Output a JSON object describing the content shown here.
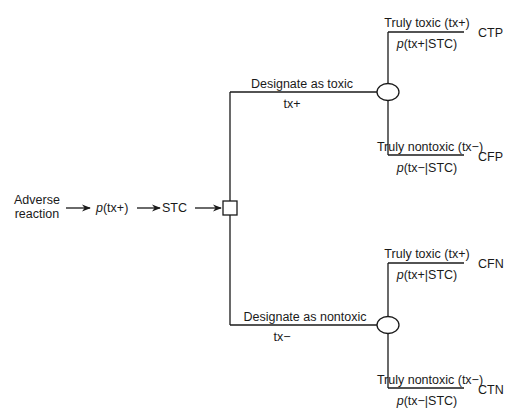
{
  "diagram": {
    "type": "decision-tree",
    "input": {
      "line1": "Adverse",
      "line2": "reaction"
    },
    "prior": {
      "p": "p",
      "arg": "(tx+)"
    },
    "test": "STC",
    "decision_node": "square",
    "branches": [
      {
        "label": "Designate as toxic",
        "code": "tx+",
        "chance_node": "circle",
        "outcomes": [
          {
            "label": "Truly toxic (tx+)",
            "prob_p": "p",
            "prob_arg": "(tx+|STC)",
            "cost": "CTP"
          },
          {
            "label": "Truly nontoxic (tx−)",
            "prob_p": "p",
            "prob_arg": "(tx−|STC)",
            "cost": "CFP"
          }
        ]
      },
      {
        "label": "Designate as nontoxic",
        "code": "tx−",
        "chance_node": "circle",
        "outcomes": [
          {
            "label": "Truly toxic (tx+)",
            "prob_p": "p",
            "prob_arg": "(tx+|STC)",
            "cost": "CFN"
          },
          {
            "label": "Truly nontoxic (tx−)",
            "prob_p": "p",
            "prob_arg": "(tx−|STC)",
            "cost": "CTN"
          }
        ]
      }
    ],
    "colors": {
      "line": "#1a1a1a",
      "background": "#ffffff"
    }
  }
}
